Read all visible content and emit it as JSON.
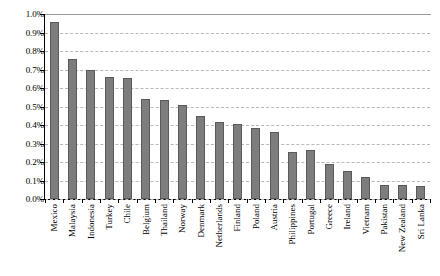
{
  "chart_data": {
    "type": "bar",
    "title": "",
    "xlabel": "",
    "ylabel": "",
    "ylim": [
      0,
      0.01
    ],
    "y_tick_labels": [
      "1.0%",
      "0.9%",
      "0.8%",
      "0.7%",
      "0.6%",
      "0.5%",
      "0.4%",
      "0.3%",
      "0.2%",
      "0.1%",
      "0.0%"
    ],
    "y_tick_values": [
      1.0,
      0.9,
      0.8,
      0.7,
      0.6,
      0.5,
      0.4,
      0.3,
      0.2,
      0.1,
      0.0
    ],
    "grid": true,
    "grid_axis": "y",
    "legend": false,
    "value_unit": "percent",
    "bar_color": "#7d7d7d",
    "bar_edge_color": "#5a5a5a",
    "gridline_color": "#b9b9b9",
    "axis_color": "#000000",
    "background": "#ffffff",
    "categories": [
      "Mexico",
      "Malaysia",
      "Indonesia",
      "Turkey",
      "Chile",
      "Belgium",
      "Thailand",
      "Norway",
      "Denmark",
      "Netherlands",
      "Finland",
      "Poland",
      "Austria",
      "Philippines",
      "Portugal",
      "Greece",
      "Ireland",
      "Vietnam",
      "Pakistan",
      "New Zealand",
      "Sri Lanka"
    ],
    "values": [
      0.955,
      0.755,
      0.7,
      0.66,
      0.655,
      0.54,
      0.535,
      0.51,
      0.45,
      0.415,
      0.405,
      0.385,
      0.36,
      0.255,
      0.265,
      0.19,
      0.15,
      0.12,
      0.075,
      0.075,
      0.07
    ],
    "value_labels": [
      "0.96%",
      "0.76%",
      "0.70%",
      "0.66%",
      "0.66%",
      "0.54%",
      "0.54%",
      "0.51%",
      "0.45%",
      "0.42%",
      "0.41%",
      "0.39%",
      "0.36%",
      "0.26%",
      "0.27%",
      "0.19%",
      "0.15%",
      "0.12%",
      "0.08%",
      "0.08%",
      "0.07%"
    ]
  }
}
